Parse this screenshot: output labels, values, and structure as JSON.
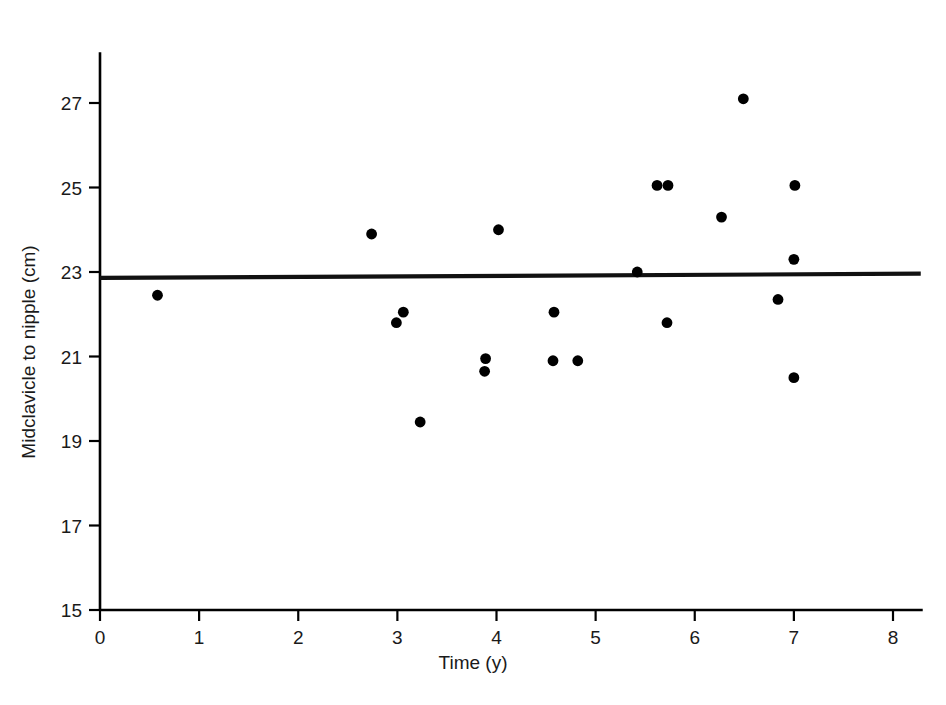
{
  "chart_data": {
    "type": "scatter",
    "title": "",
    "xlabel": "Time (y)",
    "ylabel": "Midclavicle to nipple (cm)",
    "xlim": [
      0,
      8.3
    ],
    "ylim": [
      15,
      28.2
    ],
    "xticks": [
      "0",
      "1",
      "2",
      "3",
      "4",
      "5",
      "6",
      "7",
      "8"
    ],
    "xtick_values": [
      0,
      1,
      2,
      3,
      4,
      5,
      6,
      7,
      8
    ],
    "yticks": [
      "15",
      "17",
      "19",
      "21",
      "23",
      "25",
      "27"
    ],
    "ytick_values": [
      15,
      17,
      19,
      21,
      23,
      25,
      27
    ],
    "grid": false,
    "legend": false,
    "marker": "filled-circle",
    "marker_color": "#000000",
    "series": [
      {
        "name": "observations",
        "points": [
          [
            0.58,
            22.45
          ],
          [
            2.74,
            23.9
          ],
          [
            3.06,
            22.05
          ],
          [
            2.99,
            21.8
          ],
          [
            3.23,
            19.45
          ],
          [
            3.89,
            20.95
          ],
          [
            3.88,
            20.65
          ],
          [
            4.02,
            24.0
          ],
          [
            4.58,
            22.05
          ],
          [
            4.57,
            20.9
          ],
          [
            4.82,
            20.9
          ],
          [
            5.42,
            23.0
          ],
          [
            5.62,
            25.05
          ],
          [
            5.73,
            25.05
          ],
          [
            5.72,
            21.8
          ],
          [
            6.27,
            24.3
          ],
          [
            6.49,
            27.1
          ],
          [
            6.84,
            22.35
          ],
          [
            7.0,
            23.3
          ],
          [
            7.01,
            25.05
          ],
          [
            7.0,
            20.5
          ]
        ]
      }
    ],
    "trendline": {
      "type": "linear-fit",
      "x_start": 0.0,
      "y_start": 22.86,
      "x_end": 8.28,
      "y_end": 22.96,
      "color": "#111111"
    }
  },
  "axis": {
    "x_title": "Time (y)",
    "y_title": "Midclavicle to nipple (cm)"
  }
}
